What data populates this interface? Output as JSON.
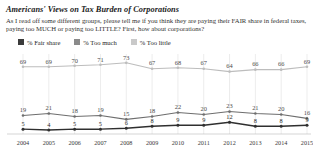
{
  "header": {
    "title": "Americans' Views on Tax Burden of Corporations",
    "question": "As I read off some different groups, please tell me if you think they are paying their FAIR share in federal taxes, paying too MUCH or paying too LITTLE? First, how about corporations?"
  },
  "legend": [
    {
      "label": "% Fair share",
      "color": "#3b3b3b",
      "swatch": "legend-swatch-fair-share"
    },
    {
      "label": "% Too much",
      "color": "#8a8a8a",
      "swatch": "legend-swatch-too-much"
    },
    {
      "label": "% Too little",
      "color": "#c9c9c9",
      "swatch": "legend-swatch-too-little"
    }
  ],
  "chart_data": {
    "type": "line",
    "title": "Americans' Views on Tax Burden of Corporations",
    "subtitle": "As I read off some different groups, please tell me if you think they are paying their FAIR share in federal taxes, paying too MUCH or paying too LITTLE? First, how about corporations?",
    "xlabel": "",
    "ylabel": "",
    "ylim": [
      0,
      80
    ],
    "grid": true,
    "grid_axis": "x",
    "legend_position": "top-left",
    "categories": [
      "2004",
      "2005",
      "2006",
      "2007",
      "2008",
      "2009",
      "2010",
      "2011",
      "2012",
      "2013",
      "2014",
      "2015"
    ],
    "series": [
      {
        "name": "% Too little",
        "color": "#bdbdbd",
        "values": [
          69,
          69,
          70,
          71,
          73,
          67,
          68,
          67,
          64,
          66,
          66,
          69
        ]
      },
      {
        "name": "% Too much",
        "color": "#6e6e6e",
        "values": [
          19,
          21,
          18,
          19,
          15,
          18,
          22,
          20,
          23,
          21,
          20,
          16
        ]
      },
      {
        "name": "% Fair share",
        "color": "#2f2f2f",
        "values": [
          5,
          4,
          5,
          5,
          6,
          8,
          9,
          9,
          12,
          8,
          8,
          9
        ]
      }
    ]
  }
}
